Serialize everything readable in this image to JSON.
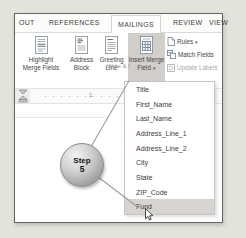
{
  "window": {
    "tabs": [
      {
        "label": "OUT"
      },
      {
        "label": "REFERENCES"
      },
      {
        "label": "MAILINGS"
      },
      {
        "label": "REVIEW"
      },
      {
        "label": "VIEW"
      }
    ],
    "active_tab": "MAILINGS"
  },
  "ribbon": {
    "buttons": {
      "highlight_merge_fields": {
        "line1": "Highlight",
        "line2": "Merge Fields"
      },
      "address_block": {
        "line1": "Address",
        "line2": "Block"
      },
      "greeting_line": {
        "line1": "Greeting",
        "line2": "Line"
      },
      "insert_merge_field": {
        "line1": "Insert Merge",
        "line2": "Field",
        "selected": true
      }
    },
    "side_buttons": {
      "rules": {
        "label": "Rules"
      },
      "match_fields": {
        "label": "Match Fields"
      },
      "update_labels": {
        "label": "Update Labels",
        "disabled": true
      }
    },
    "group_label": "Write & I"
  },
  "ruler": {
    "marks": [
      "1",
      "3"
    ]
  },
  "merge_field_menu": {
    "items": [
      "Title",
      "First_Name",
      "Last_Name",
      "Address_Line_1",
      "Address_Line_2",
      "City",
      "State",
      "ZIP_Code",
      "Fund"
    ],
    "highlighted_item": "Fund"
  },
  "step_badge": {
    "line1": "Step",
    "line2": "5"
  },
  "icons": {
    "dropdown_arrow": "▾"
  },
  "colors": {
    "selected_button_bg": "#d2cfca",
    "menu_highlight_bg": "#d7d4d0",
    "frame_border": "#666666",
    "page_bg": "#e4e3db"
  }
}
